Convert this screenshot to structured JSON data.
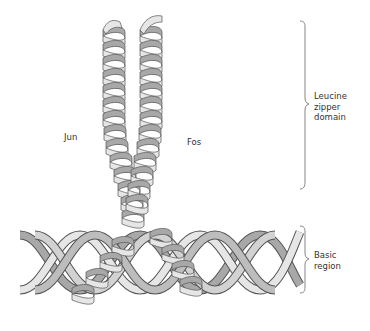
{
  "diagram": {
    "type": "molecular-structure",
    "labels": {
      "jun": "Jun",
      "fos": "Fos",
      "leucine_zipper": [
        "Leucine",
        "zipper",
        "domain"
      ],
      "basic_region": [
        "Basic",
        "region"
      ]
    },
    "colors": {
      "ribbon_light": "#e6e6e6",
      "ribbon_dark": "#a8a8a8",
      "outline": "#555555",
      "brace": "#777777",
      "text": "#333333"
    }
  }
}
